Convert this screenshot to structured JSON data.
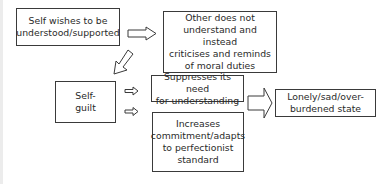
{
  "diagram": {
    "nodes": {
      "self_wishes": "Self wishes to be understood/supported",
      "other_criticises": "Other does not understand and instead criticises and reminds of moral duties",
      "self_guilt": "Self-guilt",
      "suppresses": "Suppresses its need for understanding",
      "increases": "Increases commitment/adapts to perfectionist standard",
      "lonely": "Lonely/sad/over-burdened state"
    },
    "lines": {
      "self_wishes": [
        "Self wishes to be",
        "understood/supported"
      ],
      "other_criticises": [
        "Other does not",
        "understand and instead",
        "criticises and reminds",
        "of moral duties"
      ],
      "self_guilt": [
        "Self-",
        "guilt"
      ],
      "suppresses": [
        "Suppresses its need",
        "for understanding"
      ],
      "increases": [
        "Increases",
        "commitment/adapts",
        "to perfectionist",
        "standard"
      ],
      "lonely": [
        "Lonely/sad/over-",
        "burdened state"
      ]
    },
    "edges": [
      {
        "from": "self_wishes",
        "to": "other_criticises"
      },
      {
        "from": "other_criticises",
        "to": "self_guilt"
      },
      {
        "from": "self_guilt",
        "to": "suppresses"
      },
      {
        "from": "self_guilt",
        "to": "increases"
      },
      {
        "from": "suppresses",
        "to": "lonely"
      }
    ]
  }
}
